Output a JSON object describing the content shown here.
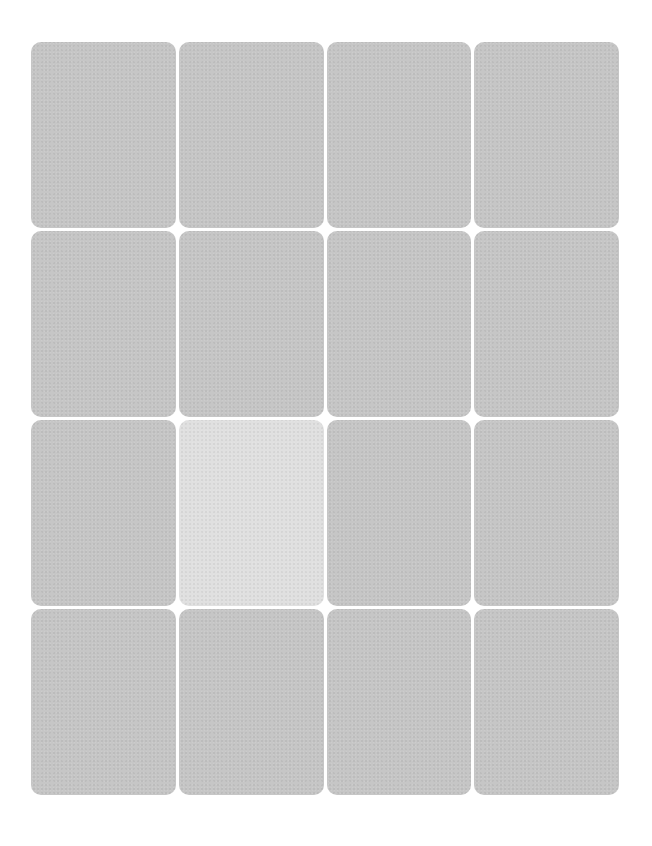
{
  "game": {
    "type": "memory-card-grid",
    "rows": 4,
    "columns": 4,
    "colors": {
      "background": "#ffffff",
      "card_face_down": "#c6c6c6",
      "card_highlighted": "#e0e0e0"
    },
    "cards": [
      {
        "row": 1,
        "col": 1,
        "state": "face-down"
      },
      {
        "row": 1,
        "col": 2,
        "state": "face-down"
      },
      {
        "row": 1,
        "col": 3,
        "state": "face-down"
      },
      {
        "row": 1,
        "col": 4,
        "state": "face-down"
      },
      {
        "row": 2,
        "col": 1,
        "state": "face-down"
      },
      {
        "row": 2,
        "col": 2,
        "state": "face-down"
      },
      {
        "row": 2,
        "col": 3,
        "state": "face-down"
      },
      {
        "row": 2,
        "col": 4,
        "state": "face-down"
      },
      {
        "row": 3,
        "col": 1,
        "state": "face-down"
      },
      {
        "row": 3,
        "col": 2,
        "state": "highlighted"
      },
      {
        "row": 3,
        "col": 3,
        "state": "face-down"
      },
      {
        "row": 3,
        "col": 4,
        "state": "face-down"
      },
      {
        "row": 4,
        "col": 1,
        "state": "face-down"
      },
      {
        "row": 4,
        "col": 2,
        "state": "face-down"
      },
      {
        "row": 4,
        "col": 3,
        "state": "face-down"
      },
      {
        "row": 4,
        "col": 4,
        "state": "face-down"
      }
    ]
  }
}
